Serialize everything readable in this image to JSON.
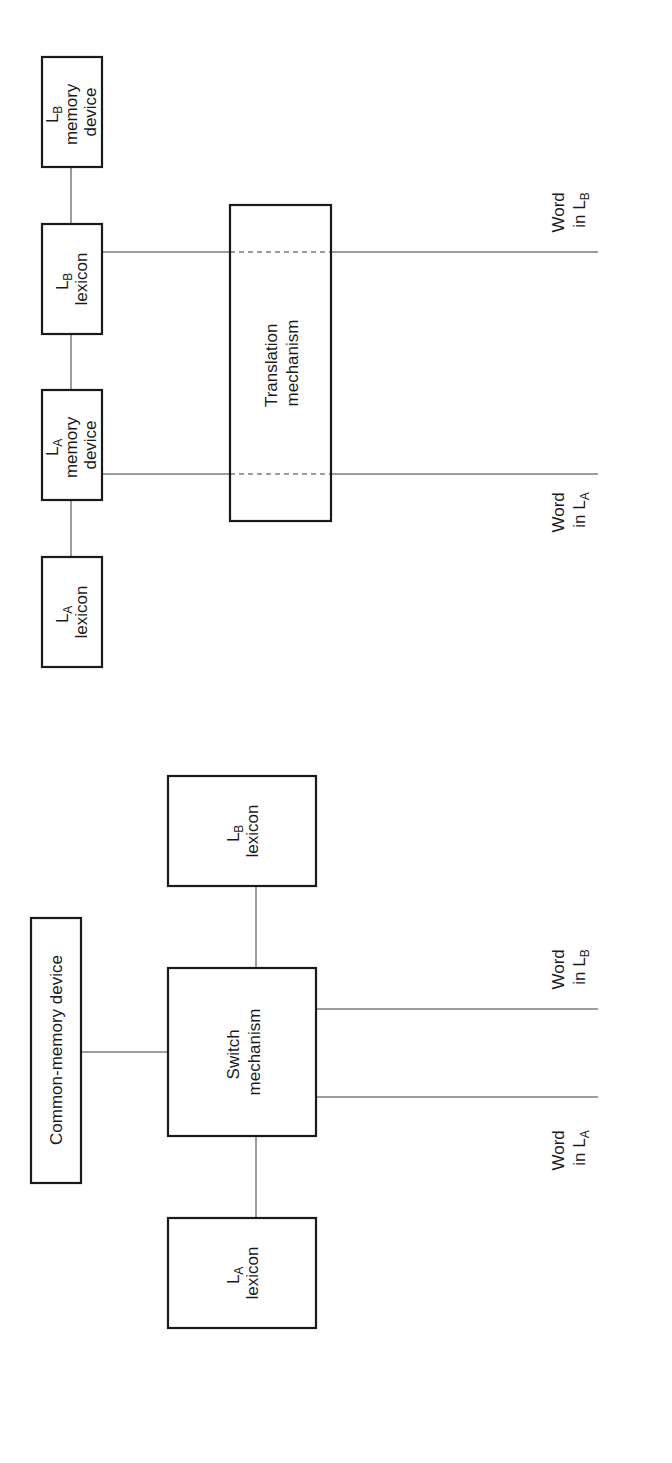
{
  "diagram": {
    "orientation": "rotated-90-ccw",
    "colors": {
      "stroke": "#1a1a1a",
      "line": "#3a3a3a",
      "background": "#ffffff"
    },
    "translation_model": {
      "boxes": {
        "lb_memory": {
          "line1_main": "L",
          "line1_sub": "B",
          "line2": "memory",
          "line3": "device"
        },
        "lb_lexicon": {
          "line1_main": "L",
          "line1_sub": "B",
          "line2": "lexicon"
        },
        "la_memory": {
          "line1_main": "L",
          "line1_sub": "A",
          "line2": "memory",
          "line3": "device"
        },
        "la_lexicon": {
          "line1_main": "L",
          "line1_sub": "A",
          "line2": "lexicon"
        },
        "translation": {
          "line1": "Translation",
          "line2": "mechanism"
        }
      },
      "outputs": {
        "word_lb": {
          "line1": "Word",
          "line2_main": "in L",
          "line2_sub": "B"
        },
        "word_la": {
          "line1": "Word",
          "line2_main": "in L",
          "line2_sub": "A"
        }
      }
    },
    "switch_model": {
      "boxes": {
        "common_memory": {
          "label": "Common-memory device"
        },
        "lb_lexicon": {
          "line1_main": "L",
          "line1_sub": "B",
          "line2": "lexicon"
        },
        "switch": {
          "line1": "Switch",
          "line2": "mechanism"
        },
        "la_lexicon": {
          "line1_main": "L",
          "line1_sub": "A",
          "line2": "lexicon"
        }
      },
      "outputs": {
        "word_lb": {
          "line1": "Word",
          "line2_main": "in L",
          "line2_sub": "B"
        },
        "word_la": {
          "line1": "Word",
          "line2_main": "in L",
          "line2_sub": "A"
        }
      }
    }
  }
}
